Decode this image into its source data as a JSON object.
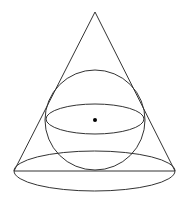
{
  "diagram": {
    "type": "geometry",
    "colors": {
      "stroke": "#333333",
      "background": "#ffffff",
      "dot": "#000000"
    },
    "cone": {
      "apex": [
        95,
        12
      ],
      "base_left": [
        14,
        171
      ],
      "base_right": [
        175,
        171
      ],
      "base_ellipse": {
        "cx": 94.5,
        "cy": 171,
        "rx": 80.5,
        "ry": 20
      }
    },
    "sphere": {
      "center": [
        95,
        120
      ],
      "radius": 50,
      "equator_ellipse": {
        "cx": 95,
        "cy": 119,
        "rx": 49,
        "ry": 15
      }
    },
    "center_dot": {
      "cx": 95,
      "cy": 120,
      "r": 2
    }
  }
}
